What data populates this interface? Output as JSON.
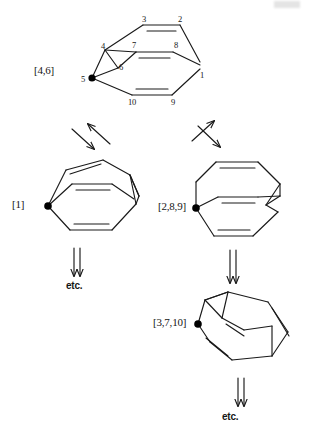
{
  "figure": {
    "type": "chemical-structure-diagram",
    "background_color": "#ffffff",
    "line_color": "#1a1a1a",
    "dot_color": "#000000"
  },
  "structures": [
    {
      "id": "s1",
      "label": "[4,6]",
      "label_pos": {
        "x": 34,
        "y": 64
      },
      "marked_atom": {
        "x": 92,
        "y": 78
      },
      "atom_numbers": [
        {
          "n": "1",
          "x": 200,
          "y": 70
        },
        {
          "n": "2",
          "x": 178,
          "y": 14
        },
        {
          "n": "3",
          "x": 142,
          "y": 14
        },
        {
          "n": "4",
          "x": 101,
          "y": 41
        },
        {
          "n": "5",
          "x": 81,
          "y": 74
        },
        {
          "n": "6",
          "x": 119,
          "y": 62
        },
        {
          "n": "7",
          "x": 132,
          "y": 44
        },
        {
          "n": "8",
          "x": 174,
          "y": 44
        },
        {
          "n": "9",
          "x": 171,
          "y": 101
        },
        {
          "n": "10",
          "x": 130,
          "y": 101
        }
      ]
    },
    {
      "id": "s2",
      "label": "[1]",
      "label_pos": {
        "x": 12,
        "y": 198
      },
      "marked_atom": {
        "x": 48,
        "y": 206
      }
    },
    {
      "id": "s3",
      "label": "[2,8,9]",
      "label_pos": {
        "x": 158,
        "y": 200
      },
      "marked_atom": {
        "x": 196,
        "y": 208
      }
    },
    {
      "id": "s4",
      "label": "[3,7,10]",
      "label_pos": {
        "x": 153,
        "y": 316
      },
      "marked_atom": {
        "x": 198,
        "y": 324
      }
    }
  ],
  "arrows": [
    {
      "id": "a1",
      "kind": "equilibrium-diagonal-left",
      "from": "s1",
      "to": "s2"
    },
    {
      "id": "a2",
      "kind": "equilibrium-diagonal-right",
      "from": "s1",
      "to": "s3"
    },
    {
      "id": "a3",
      "kind": "equilibrium-vertical",
      "from": "s2",
      "to": "etc1"
    },
    {
      "id": "a4",
      "kind": "equilibrium-vertical",
      "from": "s3",
      "to": "s4"
    },
    {
      "id": "a5",
      "kind": "equilibrium-vertical",
      "from": "s4",
      "to": "etc2"
    }
  ],
  "etc_labels": [
    {
      "id": "etc1",
      "text": "etc.",
      "x": 66,
      "y": 280
    },
    {
      "id": "etc2",
      "text": "etc.",
      "x": 222,
      "y": 411
    }
  ]
}
